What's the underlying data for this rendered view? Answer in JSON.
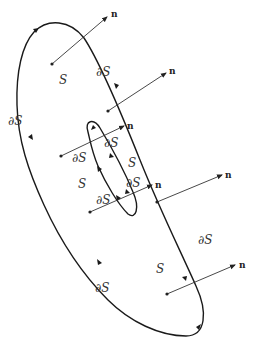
{
  "diagram": {
    "title": "",
    "labels": {
      "surface": "S",
      "boundary": "∂S",
      "normal": "n"
    },
    "surface_labels": [
      {
        "text": "S",
        "x": 59,
        "y": 84
      },
      {
        "text": "S",
        "x": 128,
        "y": 167
      },
      {
        "text": "S",
        "x": 78,
        "y": 188
      },
      {
        "text": "S",
        "x": 156,
        "y": 273
      }
    ],
    "boundary_labels": [
      {
        "text": "∂S",
        "x": 96,
        "y": 76
      },
      {
        "text": "∂S",
        "x": 8,
        "y": 125
      },
      {
        "text": "∂S",
        "x": 104,
        "y": 147
      },
      {
        "text": "∂S",
        "x": 72,
        "y": 162
      },
      {
        "text": "∂S",
        "x": 126,
        "y": 187
      },
      {
        "text": "∂S",
        "x": 96,
        "y": 204
      },
      {
        "text": "∂S",
        "x": 198,
        "y": 244
      },
      {
        "text": "∂S",
        "x": 95,
        "y": 292
      }
    ],
    "normal_vectors": [
      {
        "from": [
          52,
          64
        ],
        "to": [
          107,
          17
        ],
        "label": "n",
        "lx": 111,
        "ly": 17
      },
      {
        "from": [
          108,
          111
        ],
        "to": [
          166,
          73
        ],
        "label": "n",
        "lx": 169,
        "ly": 74
      },
      {
        "from": [
          61,
          156
        ],
        "to": [
          124,
          126
        ],
        "label": "n",
        "lx": 127,
        "ly": 129
      },
      {
        "from": [
          90,
          212
        ],
        "to": [
          152,
          185
        ],
        "label": "n",
        "lx": 155,
        "ly": 188
      },
      {
        "from": [
          157,
          202
        ],
        "to": [
          222,
          175
        ],
        "label": "n",
        "lx": 225,
        "ly": 178
      },
      {
        "from": [
          167,
          294
        ],
        "to": [
          235,
          265
        ],
        "label": "n",
        "lx": 239,
        "ly": 268
      }
    ],
    "colors": {
      "stroke": "#1a1a1a",
      "background": "#ffffff"
    }
  }
}
